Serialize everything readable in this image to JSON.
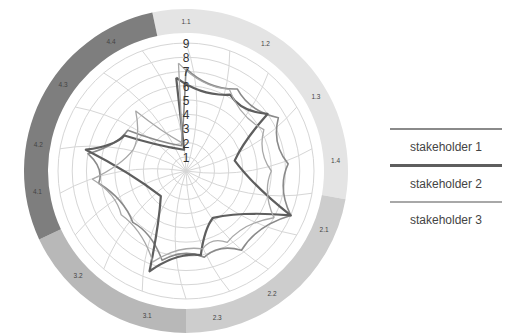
{
  "chart_data": {
    "type": "radar",
    "title": "",
    "radial_ticks": [
      "1",
      "2",
      "3",
      "4",
      "5",
      "6",
      "7",
      "8",
      "9"
    ],
    "rmax": 9,
    "categories": [
      "1.1",
      "1.2",
      "1.3",
      "1.4",
      "2.1",
      "2.2",
      "2.3",
      "3.1",
      "3.2",
      "4.1",
      "4.2",
      "4.3",
      "4.4"
    ],
    "groups": [
      {
        "name": "1",
        "items": [
          "1.1",
          "1.2",
          "1.3",
          "1.4"
        ],
        "color": "#e4e4e4",
        "start_deg": -12,
        "end_deg": 100
      },
      {
        "name": "2",
        "items": [
          "2.1",
          "2.2",
          "2.3"
        ],
        "color": "#cdcdcd",
        "start_deg": 100,
        "end_deg": 180
      },
      {
        "name": "3",
        "items": [
          "3.1",
          "3.2"
        ],
        "color": "#b8b8b8",
        "start_deg": 180,
        "end_deg": 245
      },
      {
        "name": "4",
        "items": [
          "4.1",
          "4.2",
          "4.3",
          "4.4"
        ],
        "color": "#7e7e7e",
        "start_deg": 245,
        "end_deg": 348
      }
    ],
    "label_angles_deg": [
      0,
      32,
      60,
      86,
      113,
      145,
      168,
      195,
      226,
      262,
      280,
      305,
      330
    ],
    "series": [
      {
        "name": "stakeholder 1",
        "color": "#8a8a8a",
        "width": 1.6,
        "points": [
          [
            0,
            7.2
          ],
          [
            32,
            6.8
          ],
          [
            60,
            7.5
          ],
          [
            86,
            7.2
          ],
          [
            113,
            8.0
          ],
          [
            145,
            6.8
          ],
          [
            168,
            6.2
          ],
          [
            195,
            6.5
          ],
          [
            226,
            5.2
          ],
          [
            262,
            6.2
          ],
          [
            280,
            7.0
          ],
          [
            305,
            5.0
          ],
          [
            350,
            1.8
          ]
        ]
      },
      {
        "name": "stakeholder 2",
        "color": "#5e5e5e",
        "width": 2.2,
        "points": [
          [
            -6,
            6.6
          ],
          [
            30,
            6.2
          ],
          [
            55,
            7.0
          ],
          [
            78,
            3.5
          ],
          [
            113,
            8.0
          ],
          [
            150,
            3.8
          ],
          [
            170,
            6.0
          ],
          [
            200,
            7.5
          ],
          [
            225,
            2.5
          ],
          [
            282,
            7.2
          ],
          [
            300,
            5.0
          ],
          [
            355,
            1.5
          ]
        ]
      },
      {
        "name": "stakeholder 3",
        "color": "#a8a8a8",
        "width": 1.3,
        "points": [
          [
            -4,
            7.6
          ],
          [
            28,
            6.5
          ],
          [
            62,
            6.2
          ],
          [
            90,
            6.0
          ],
          [
            118,
            7.0
          ],
          [
            150,
            5.8
          ],
          [
            168,
            5.6
          ],
          [
            200,
            6.8
          ],
          [
            236,
            5.5
          ],
          [
            265,
            6.6
          ],
          [
            292,
            4.0
          ],
          [
            320,
            5.5
          ],
          [
            352,
            2.0
          ]
        ]
      }
    ],
    "legend_position": "right",
    "grid": true
  },
  "legend": {
    "items": [
      {
        "label": "stakeholder 1",
        "color": "#8a8a8a"
      },
      {
        "label": "stakeholder 2",
        "color": "#5e5e5e"
      },
      {
        "label": "stakeholder 3",
        "color": "#a8a8a8"
      }
    ]
  }
}
